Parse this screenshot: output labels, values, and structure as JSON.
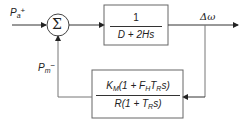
{
  "diagram": {
    "type": "block-diagram",
    "summing_junction": {
      "symbol": "Σ"
    },
    "input": {
      "symbol": "P",
      "subscript": "a",
      "sign": "+"
    },
    "feedback_input": {
      "symbol": "P",
      "subscript": "m",
      "sign": "−"
    },
    "forward_block": {
      "numerator": "1",
      "denominator": "D + 2Hs"
    },
    "feedback_block": {
      "numerator_parts": [
        "K",
        "M",
        "(1 + F",
        "H",
        "T",
        "R",
        "s)"
      ],
      "denominator_parts": [
        "R(1 + T",
        "R",
        "s)"
      ]
    },
    "output": {
      "label": "Δω"
    },
    "colors": {
      "line": "#333333",
      "box_line": "#666666"
    }
  }
}
